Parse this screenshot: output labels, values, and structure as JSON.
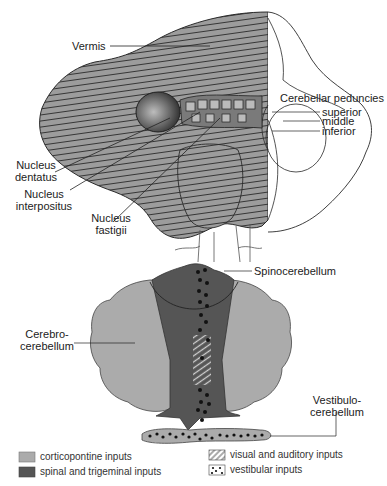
{
  "top_diagram": {
    "labels": {
      "vermis": "Vermis",
      "cerebellar_peduncles": "Cerebellar peduncies",
      "superior": "superior",
      "middle": "middle",
      "inferior": "inferior",
      "nucleus_dentatus_1": "Nucleus",
      "nucleus_dentatus_2": "dentatus",
      "nucleus_interpositus_1": "Nucleus",
      "nucleus_interpositus_2": "interpositus",
      "nucleus_fastigii_1": "Nucleus",
      "nucleus_fastigii_2": "fastigii"
    }
  },
  "bottom_diagram": {
    "labels": {
      "spinocerebellum": "Spinocerebellum",
      "cerebrocerebellum_1": "Cerebro-",
      "cerebrocerebellum_2": "cerebellum",
      "vestibulocerebellum_1": "Vestibulo-",
      "vestibulocerebellum_2": "cerebellum"
    }
  },
  "legend": {
    "items": [
      {
        "label": "corticopontine inputs",
        "pattern": "light-gray",
        "color": "#ababab"
      },
      {
        "label": "spinal and trigeminal inputs",
        "pattern": "dark-gray",
        "color": "#555555"
      },
      {
        "label": "visual and auditory inputs",
        "pattern": "hatched",
        "color": "#ffffff"
      },
      {
        "label": "vestibular inputs",
        "pattern": "dotted",
        "color": "#ffffff"
      }
    ]
  },
  "colors": {
    "light_gray": "#ababab",
    "dark_gray": "#555555",
    "outline": "#2a2a2a",
    "cerebellum_fill": "#9c9c9c"
  }
}
